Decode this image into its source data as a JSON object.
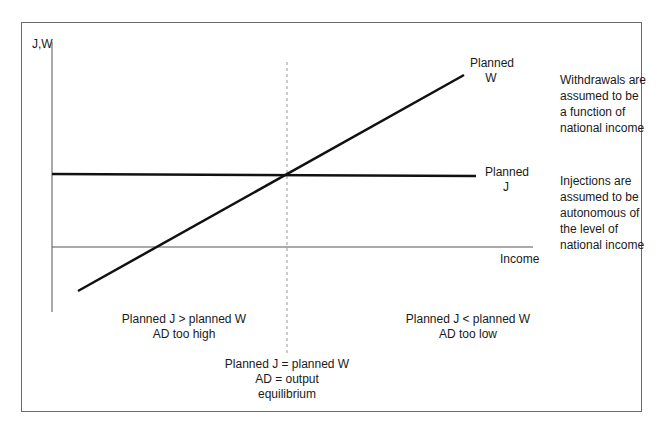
{
  "diagram": {
    "y_axis_label": "J,W",
    "x_axis_label": "Income",
    "lines": {
      "withdrawals": {
        "label_line1": "Planned",
        "label_line2": "W"
      },
      "injections": {
        "label_line1": "Planned",
        "label_line2": "J"
      }
    },
    "side_notes": {
      "withdrawals": [
        "Withdrawals are",
        "assumed to be",
        "a function of",
        "national income"
      ],
      "injections": [
        "Injections are",
        "assumed to be",
        "autonomous of",
        "the level of",
        "national income"
      ]
    },
    "regions": {
      "left": {
        "line1": "Planned J > planned W",
        "line2": "AD too high"
      },
      "right": {
        "line1": "Planned J < planned W",
        "line2": "AD too low"
      },
      "equilibrium": {
        "line1": "Planned J = planned W",
        "line2": "AD = output",
        "line3": "equilibrium"
      }
    },
    "colors": {
      "frame": "#6a6a6a",
      "axis": "#555555",
      "curve": "#111111",
      "dashed": "#9a9a9a",
      "text": "#1a1a1a"
    }
  }
}
